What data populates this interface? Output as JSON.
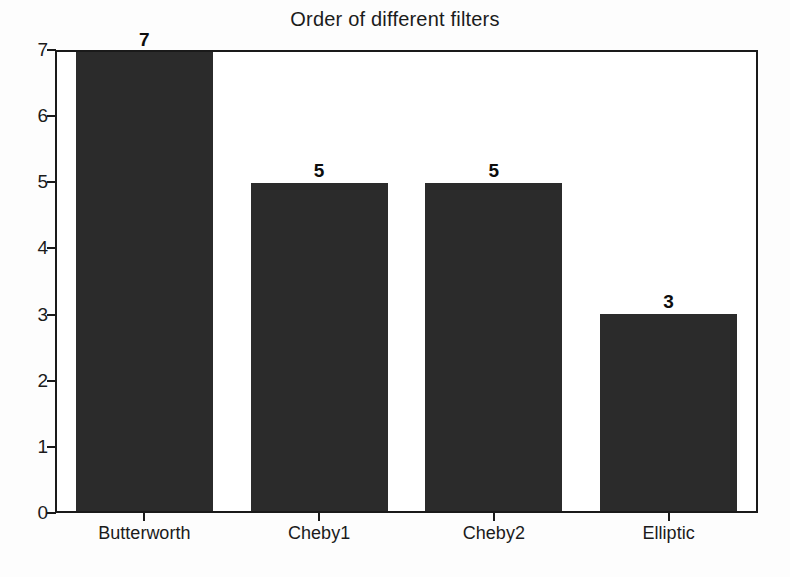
{
  "chart_data": {
    "type": "bar",
    "title": "Order of different filters",
    "xlabel": "",
    "ylabel": "",
    "categories": [
      "Butterworth",
      "Cheby1",
      "Cheby2",
      "Elliptic"
    ],
    "values": [
      7,
      5,
      5,
      3
    ],
    "data_labels": [
      "7",
      "5",
      "5",
      "3"
    ],
    "ylim": [
      0,
      7
    ],
    "yticks": [
      0,
      1,
      2,
      3,
      4,
      5,
      6,
      7
    ],
    "ytick_labels": [
      "0",
      "1",
      "2",
      "3",
      "4",
      "5",
      "6",
      "7"
    ],
    "grid": false,
    "legend": false,
    "bar_color": "#2b2b2b",
    "axis_color": "#1a1a1a",
    "background_color": "#ffffff"
  }
}
